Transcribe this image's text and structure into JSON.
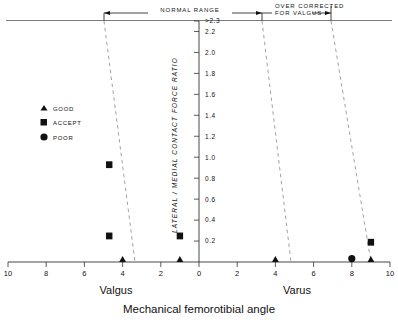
{
  "chart_data": {
    "type": "scatter",
    "title": "",
    "xlabel": "Mechanical femorotibial angle",
    "ylabel": "LATERAL / MEDIAL CONTACT FORCE RATIO",
    "xlim": [
      -10,
      10
    ],
    "ylim": [
      0,
      2.3
    ],
    "grid": false,
    "legend_position": "left-middle",
    "x_ticks": [
      {
        "value": -10,
        "label": "10"
      },
      {
        "value": -8,
        "label": "8"
      },
      {
        "value": -6,
        "label": "6"
      },
      {
        "value": -4,
        "label": "4"
      },
      {
        "value": -2,
        "label": "2"
      },
      {
        "value": 0,
        "label": "0"
      },
      {
        "value": 2,
        "label": "2"
      },
      {
        "value": 4,
        "label": "4"
      },
      {
        "value": 6,
        "label": "6"
      },
      {
        "value": 8,
        "label": "8"
      },
      {
        "value": 10,
        "label": "10"
      }
    ],
    "y_ticks": [
      {
        "value": 2.3,
        "label": "2.3"
      },
      {
        "value": 2.2,
        "label": "2.2"
      },
      {
        "value": 2.0,
        "label": "2.0"
      },
      {
        "value": 1.8,
        "label": "1.8"
      },
      {
        "value": 1.6,
        "label": "1.6"
      },
      {
        "value": 1.4,
        "label": "1.4"
      },
      {
        "value": 1.2,
        "label": "1.2"
      },
      {
        "value": 1.0,
        "label": "1.0"
      },
      {
        "value": 0.8,
        "label": "0.8"
      },
      {
        "value": 0.6,
        "label": "0.6"
      },
      {
        "value": 0.4,
        "label": "0.4"
      },
      {
        "value": 0.2,
        "label": "0.2"
      }
    ],
    "x_side_labels": {
      "left": "Valgus",
      "right": "Varus"
    },
    "legend": [
      {
        "label": "GOOD",
        "marker": "triangle"
      },
      {
        "label": "ACCEPT",
        "marker": "square"
      },
      {
        "label": "POOR",
        "marker": "circle"
      }
    ],
    "brackets": [
      {
        "label": "NORMAL RANGE",
        "x_start": -5.0,
        "x_end": 3.4
      },
      {
        "label": "OVER CORRECTED FOR VALGUS",
        "x_start": 3.4,
        "x_end": 6.9
      }
    ],
    "reference_lines": [
      {
        "x_top": -5.0,
        "x_bottom": -3.4,
        "style": "dashed"
      },
      {
        "x_top": 3.4,
        "x_bottom": 4.9,
        "style": "dashed"
      },
      {
        "x_top": 6.9,
        "x_bottom": 9.0,
        "style": "dashed"
      }
    ],
    "series": [
      {
        "name": "GOOD",
        "marker": "triangle",
        "points": [
          {
            "x": -4.0,
            "y": 0.0
          },
          {
            "x": -1.0,
            "y": 0.0
          },
          {
            "x": 4.0,
            "y": 0.0
          },
          {
            "x": 9.0,
            "y": 0.0
          }
        ]
      },
      {
        "name": "ACCEPT",
        "marker": "square",
        "points": [
          {
            "x": -4.7,
            "y": 0.9
          },
          {
            "x": -4.7,
            "y": 0.22
          },
          {
            "x": -1.0,
            "y": 0.22
          },
          {
            "x": 9.0,
            "y": 0.16
          }
        ]
      },
      {
        "name": "POOR",
        "marker": "circle",
        "points": [
          {
            "x": 8.0,
            "y": 0.0
          }
        ]
      }
    ],
    "colors": {
      "ink": "#111111",
      "dash": "#777777",
      "axis": "#333333"
    }
  }
}
